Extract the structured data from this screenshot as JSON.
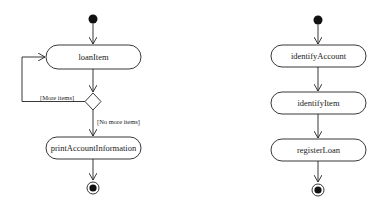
{
  "diagram": {
    "type": "UML activity diagram",
    "left": {
      "actions": [
        "loanItem",
        "printAccountInformation"
      ],
      "decision": {
        "guards": {
          "loop": "[More items]",
          "exit": "[No more items]"
        }
      }
    },
    "right": {
      "actions": [
        "identifyAccount",
        "identifyItem",
        "registerLoan"
      ]
    }
  }
}
